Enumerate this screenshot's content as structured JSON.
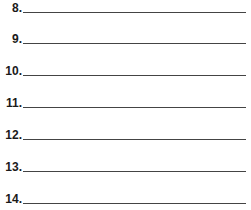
{
  "items": [
    {
      "number": "8.",
      "value": ""
    },
    {
      "number": "9.",
      "value": ""
    },
    {
      "number": "10.",
      "value": ""
    },
    {
      "number": "11.",
      "value": ""
    },
    {
      "number": "12.",
      "value": ""
    },
    {
      "number": "13.",
      "value": ""
    },
    {
      "number": "14.",
      "value": ""
    }
  ]
}
